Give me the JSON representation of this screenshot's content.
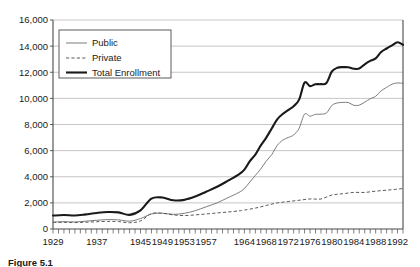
{
  "chart_data": {
    "type": "line",
    "title": "",
    "xlabel": "",
    "ylabel": "",
    "xlim": [
      1929,
      1993
    ],
    "ylim": [
      0,
      16000
    ],
    "grid": true,
    "legend_position": "upper-left-inside",
    "ytick_labels": [
      "0",
      "2,000",
      "4,000",
      "6,000",
      "8,000",
      "10,000",
      "12,000",
      "14,000",
      "16,000"
    ],
    "ytick_values": [
      0,
      2000,
      4000,
      6000,
      8000,
      10000,
      12000,
      14000,
      16000
    ],
    "xtick_labels": [
      "1929",
      "1937",
      "1945",
      "1949",
      "1953",
      "1957",
      "1964",
      "1968",
      "1972",
      "1976",
      "1980",
      "1984",
      "1988",
      "1992"
    ],
    "xtick_values": [
      1929,
      1937,
      1945,
      1949,
      1953,
      1957,
      1964,
      1968,
      1972,
      1976,
      1980,
      1984,
      1988,
      1992
    ],
    "series": [
      {
        "name": "Public",
        "style": "thin-solid-gray",
        "color": "#6e6e6e",
        "x": [
          1929,
          1931,
          1933,
          1935,
          1937,
          1939,
          1941,
          1943,
          1945,
          1947,
          1949,
          1951,
          1953,
          1955,
          1957,
          1959,
          1961,
          1963,
          1964,
          1965,
          1966,
          1967,
          1968,
          1969,
          1970,
          1971,
          1972,
          1973,
          1974,
          1975,
          1976,
          1977,
          1978,
          1979,
          1980,
          1981,
          1982,
          1983,
          1984,
          1985,
          1986,
          1987,
          1988,
          1989,
          1990,
          1991,
          1992,
          1993
        ],
        "values": [
          530,
          560,
          540,
          600,
          670,
          720,
          700,
          600,
          800,
          1150,
          1210,
          1120,
          1200,
          1400,
          1700,
          2000,
          2400,
          2800,
          3100,
          3600,
          4100,
          4600,
          5200,
          5700,
          6400,
          6800,
          7000,
          7200,
          7700,
          8800,
          8640,
          8780,
          8790,
          8880,
          9460,
          9650,
          9690,
          9680,
          9470,
          9480,
          9710,
          9970,
          10160,
          10580,
          10840,
          11090,
          11180,
          11150
        ],
        "notes": "Thin gray line; public institution enrollment in thousands"
      },
      {
        "name": "Private",
        "style": "dashed-gray",
        "color": "#5a5a5a",
        "x": [
          1929,
          1931,
          1933,
          1935,
          1937,
          1939,
          1941,
          1943,
          1945,
          1947,
          1949,
          1951,
          1953,
          1955,
          1957,
          1959,
          1961,
          1963,
          1964,
          1966,
          1968,
          1970,
          1972,
          1974,
          1976,
          1978,
          1980,
          1982,
          1984,
          1986,
          1988,
          1990,
          1992,
          1993
        ],
        "values": [
          500,
          510,
          490,
          520,
          560,
          580,
          570,
          480,
          620,
          1180,
          1200,
          1080,
          1030,
          1080,
          1150,
          1230,
          1300,
          1390,
          1450,
          1600,
          1800,
          2000,
          2100,
          2200,
          2300,
          2300,
          2600,
          2700,
          2800,
          2800,
          2900,
          2970,
          3050,
          3100
        ],
        "notes": "Dashed gray line; private institution enrollment in thousands"
      },
      {
        "name": "Total Enrollment",
        "style": "thick-solid-black",
        "color": "#1a1a1a",
        "x": [
          1929,
          1931,
          1933,
          1935,
          1937,
          1939,
          1941,
          1943,
          1945,
          1947,
          1949,
          1951,
          1953,
          1955,
          1957,
          1959,
          1961,
          1963,
          1964,
          1965,
          1966,
          1967,
          1968,
          1969,
          1970,
          1971,
          1972,
          1973,
          1974,
          1975,
          1976,
          1977,
          1978,
          1979,
          1980,
          1981,
          1982,
          1983,
          1984,
          1985,
          1986,
          1987,
          1988,
          1989,
          1990,
          1991,
          1992,
          1993
        ],
        "values": [
          1030,
          1070,
          1030,
          1120,
          1230,
          1300,
          1270,
          1080,
          1420,
          2330,
          2410,
          2200,
          2230,
          2480,
          2850,
          3230,
          3700,
          4190,
          4550,
          5200,
          5700,
          6400,
          7000,
          7700,
          8400,
          8800,
          9100,
          9400,
          9900,
          11200,
          10940,
          11080,
          11090,
          11180,
          12060,
          12350,
          12390,
          12380,
          12270,
          12280,
          12610,
          12870,
          13060,
          13550,
          13820,
          14060,
          14300,
          14100
        ],
        "notes": "Thick black line; total enrollment = public + private, in thousands"
      }
    ],
    "legend_entries": [
      {
        "label": "Public",
        "style": "thin-solid-gray"
      },
      {
        "label": "Private",
        "style": "dashed-gray"
      },
      {
        "label": "Total Enrollment",
        "style": "thick-solid-black"
      }
    ]
  },
  "caption": {
    "text": "Figure 5.1"
  }
}
